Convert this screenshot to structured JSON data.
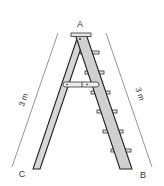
{
  "diagram": {
    "points": {
      "A": {
        "label": "A",
        "x": 80,
        "y": 26
      },
      "B": {
        "label": "B",
        "x": 143,
        "y": 179
      },
      "C": {
        "label": "C",
        "x": 22,
        "y": 178
      }
    },
    "measurements": {
      "left": {
        "label": "3 m",
        "side": "AC"
      },
      "right": {
        "label": "3 m",
        "side": "AB"
      }
    },
    "colors": {
      "ladder_fill": "#d4d4d4",
      "outline": "#222222",
      "measure_line": "#888888",
      "text": "#333333"
    },
    "steps_count": 6
  }
}
